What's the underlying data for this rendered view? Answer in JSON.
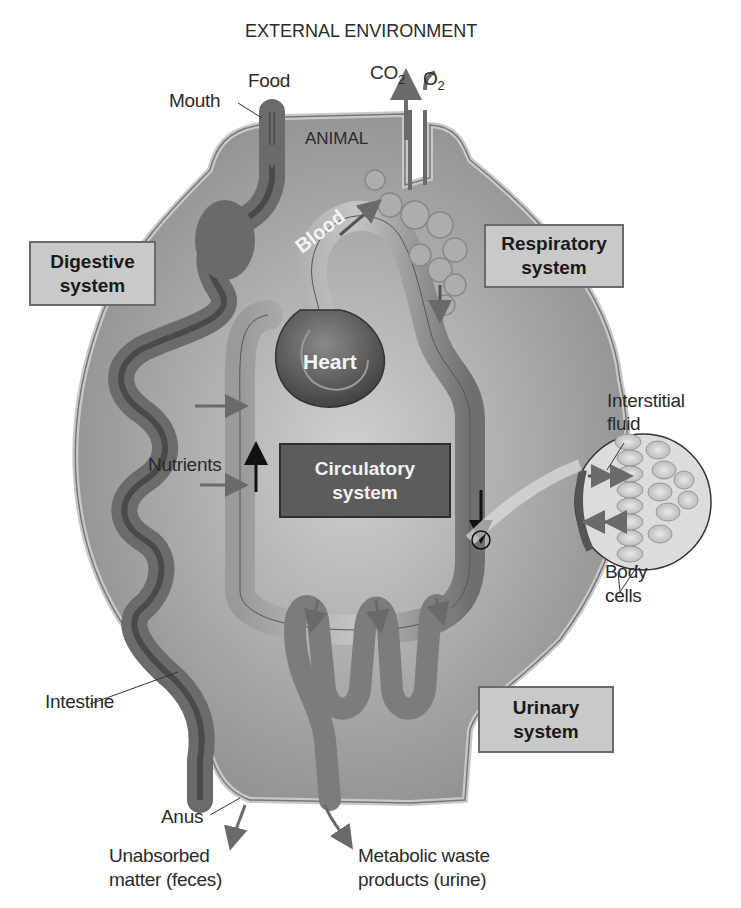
{
  "title": "EXTERNAL ENVIRONMENT",
  "animal_label": "ANIMAL",
  "inputs": {
    "food": "Food",
    "mouth": "Mouth",
    "co2": "CO",
    "co2_sub": "2",
    "o2": "O",
    "o2_sub": "2"
  },
  "systems": {
    "digestive": [
      "Digestive",
      "system"
    ],
    "respiratory": [
      "Respiratory",
      "system"
    ],
    "circulatory": [
      "Circulatory",
      "system"
    ],
    "urinary": [
      "Urinary",
      "system"
    ]
  },
  "organs": {
    "heart": "Heart",
    "blood": "Blood",
    "intestine": "Intestine",
    "anus": "Anus"
  },
  "labels": {
    "nutrients": "Nutrients",
    "interstitial_fluid": [
      "Interstitial",
      "fluid"
    ],
    "body_cells": [
      "Body",
      "cells"
    ],
    "feces": [
      "Unabsorbed",
      "matter (feces)"
    ],
    "urine": [
      "Metabolic waste",
      "products (urine)"
    ]
  },
  "colors": {
    "body_fill": "#8f8f8f",
    "body_border": "#c8c8c8",
    "inner_fill": "#b5b5b5",
    "tube": "#7a7a7a",
    "box_fill": "#c9c9c9",
    "dark_box": "#5c5c5c",
    "arrow": "#6a6a6a"
  }
}
